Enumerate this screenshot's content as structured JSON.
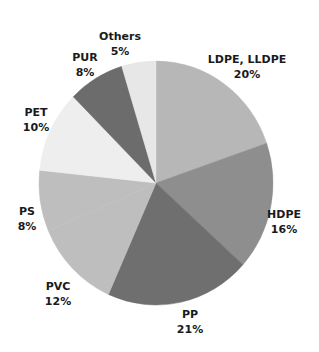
{
  "chart_data": {
    "type": "pie",
    "title": "",
    "categories": [
      "LDPE, LLDPE",
      "HDPE",
      "PP",
      "PVC",
      "PS",
      "PET",
      "PUR",
      "Others"
    ],
    "values": [
      20,
      16,
      21,
      12,
      8,
      10,
      8,
      5
    ],
    "labels_text": [
      "20%",
      "16%",
      "21%",
      "12%",
      "8%",
      "10%",
      "8%",
      "5%"
    ],
    "legend": "none (direct labels)",
    "slices": [
      {
        "name": "LDPE, LLDPE",
        "pct": "20%",
        "color": "#b7b7b7",
        "start": 0,
        "end": 71,
        "lx": 247,
        "ly": 52
      },
      {
        "name": "HDPE",
        "pct": "16%",
        "color": "#8e8e8e",
        "start": 71,
        "end": 132,
        "lx": 284,
        "ly": 207
      },
      {
        "name": "PP",
        "pct": "21%",
        "color": "#6f6f6f",
        "start": 132,
        "end": 204,
        "lx": 190,
        "ly": 307
      },
      {
        "name": "PVC",
        "pct": "12%",
        "color": "#bebebe",
        "start": 204,
        "end": 247,
        "lx": 58,
        "ly": 279
      },
      {
        "name": "PS",
        "pct": "8%",
        "color": "#bebebe",
        "start": 247,
        "end": 276,
        "lx": 27,
        "ly": 204
      },
      {
        "name": "PET",
        "pct": "10%",
        "color": "#eeeeee",
        "start": 276,
        "end": 315,
        "lx": 36,
        "ly": 105
      },
      {
        "name": "PUR",
        "pct": "8%",
        "color": "#6c6c6c",
        "start": 315,
        "end": 343,
        "lx": 85,
        "ly": 50
      },
      {
        "name": "Others",
        "pct": "5%",
        "color": "#e7e7e7",
        "start": 343,
        "end": 360,
        "lx": 120,
        "ly": 29
      }
    ],
    "geometry": {
      "cx": 156,
      "cy": 183,
      "rx": 117,
      "ry": 122
    }
  }
}
